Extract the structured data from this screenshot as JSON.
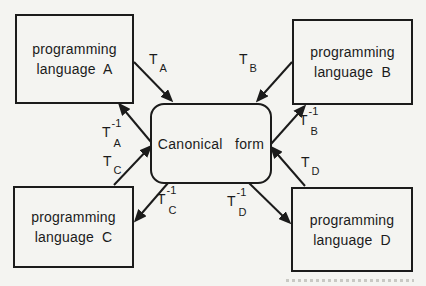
{
  "colors": {
    "background": "#f4f4f1",
    "ink": "#1b1b1b"
  },
  "nodes": {
    "lang_a": {
      "line1": "programming",
      "line2": "language A"
    },
    "lang_b": {
      "line1": "programming",
      "line2": "language B"
    },
    "lang_c": {
      "line1": "programming",
      "line2": "language C"
    },
    "lang_d": {
      "line1": "programming",
      "line2": "language D"
    },
    "canonical": {
      "label": "Canonical form"
    }
  },
  "transforms": {
    "ta": {
      "base": "T",
      "sub": "A"
    },
    "tb": {
      "base": "T",
      "sub": "B"
    },
    "tc": {
      "base": "T",
      "sub": "C"
    },
    "td": {
      "base": "T",
      "sub": "D"
    },
    "ta_inv": {
      "base": "T",
      "sup": "-1",
      "sub": "A"
    },
    "tb_inv": {
      "base": "T",
      "sup": "-1",
      "sub": "B"
    },
    "tc_inv": {
      "base": "T",
      "sup": "-1",
      "sub": "C"
    },
    "td_inv": {
      "base": "T",
      "sup": "-1",
      "sub": "D"
    }
  }
}
